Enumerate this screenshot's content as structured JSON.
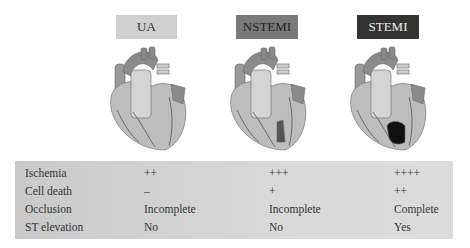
{
  "columns": [
    {
      "label": "UA",
      "bg": "#cfcfcf",
      "fg": "#333333",
      "infarct": "none"
    },
    {
      "label": "NSTEMI",
      "bg": "#7a7a7a",
      "fg": "#222222",
      "infarct": "partial"
    },
    {
      "label": "STEMI",
      "bg": "#333333",
      "fg": "#eeeeee",
      "infarct": "full"
    }
  ],
  "table": {
    "rows": [
      {
        "label": "Ischemia",
        "values": [
          "++",
          "+++",
          "++++"
        ]
      },
      {
        "label": "Cell death",
        "values": [
          "–",
          "+",
          "++"
        ]
      },
      {
        "label": "Occlusion",
        "values": [
          "Incomplete",
          "Incomplete",
          "Complete"
        ]
      },
      {
        "label": "ST elevation",
        "values": [
          "No",
          "No",
          "Yes"
        ]
      }
    ]
  }
}
